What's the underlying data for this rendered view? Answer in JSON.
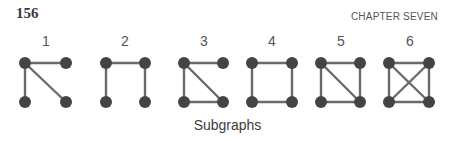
{
  "header": {
    "page_number": "156",
    "chapter_title": "CHAPTER SEVEN"
  },
  "figure": {
    "caption": "Subgraphs",
    "colors": {
      "node": "#444444",
      "edge": "#6a6a6a",
      "label": "#555555"
    },
    "subgraphs": [
      {
        "label": "1",
        "label_x": 46,
        "nodes": {
          "TL": [
            25,
            63
          ],
          "TR": [
            66,
            63
          ],
          "BL": [
            25,
            102
          ],
          "BR": [
            66,
            102
          ]
        },
        "edges": [
          [
            "TL",
            "TR"
          ],
          [
            "TL",
            "BL"
          ],
          [
            "TL",
            "BR"
          ]
        ]
      },
      {
        "label": "2",
        "label_x": 125,
        "nodes": {
          "TL": [
            106,
            63
          ],
          "TR": [
            145,
            63
          ],
          "BL": [
            106,
            102
          ],
          "BR": [
            145,
            102
          ]
        },
        "edges": [
          [
            "TL",
            "TR"
          ],
          [
            "TL",
            "BL"
          ],
          [
            "TR",
            "BR"
          ]
        ]
      },
      {
        "label": "3",
        "label_x": 204,
        "nodes": {
          "TL": [
            184,
            63
          ],
          "TR": [
            223,
            63
          ],
          "BL": [
            184,
            102
          ],
          "BR": [
            223,
            102
          ]
        },
        "edges": [
          [
            "TL",
            "TR"
          ],
          [
            "TL",
            "BL"
          ],
          [
            "TL",
            "BR"
          ],
          [
            "BL",
            "BR"
          ]
        ]
      },
      {
        "label": "4",
        "label_x": 272,
        "nodes": {
          "TL": [
            252,
            63
          ],
          "TR": [
            292,
            63
          ],
          "BL": [
            252,
            102
          ],
          "BR": [
            292,
            102
          ]
        },
        "edges": [
          [
            "TL",
            "TR"
          ],
          [
            "TL",
            "BL"
          ],
          [
            "TR",
            "BR"
          ],
          [
            "BL",
            "BR"
          ]
        ]
      },
      {
        "label": "5",
        "label_x": 341,
        "nodes": {
          "TL": [
            321,
            63
          ],
          "TR": [
            360,
            63
          ],
          "BL": [
            321,
            102
          ],
          "BR": [
            360,
            102
          ]
        },
        "edges": [
          [
            "TL",
            "TR"
          ],
          [
            "TL",
            "BL"
          ],
          [
            "TR",
            "BR"
          ],
          [
            "BL",
            "BR"
          ],
          [
            "TL",
            "BR"
          ]
        ]
      },
      {
        "label": "6",
        "label_x": 410,
        "nodes": {
          "TL": [
            389,
            63
          ],
          "TR": [
            429,
            63
          ],
          "BL": [
            389,
            102
          ],
          "BR": [
            429,
            102
          ]
        },
        "edges": [
          [
            "TL",
            "TR"
          ],
          [
            "TL",
            "BL"
          ],
          [
            "TR",
            "BR"
          ],
          [
            "BL",
            "BR"
          ],
          [
            "TL",
            "BR"
          ],
          [
            "TR",
            "BL"
          ]
        ]
      }
    ]
  }
}
